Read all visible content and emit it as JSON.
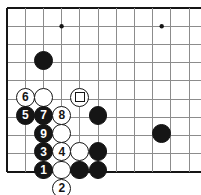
{
  "figure": {
    "board": {
      "origin_x": 7,
      "origin_y": 8,
      "spacing": 18.2,
      "cols": 11,
      "rows": 10,
      "line_color": "#8c8c8c",
      "edge_color": "#151515",
      "background": "#ffffff",
      "left_edge_thick": true,
      "top_edge_thick": true,
      "bottom_edge_thick": true,
      "right_edge_thick": false,
      "bottom_row_index": 9,
      "star_points": [
        {
          "col": 3,
          "row": 1
        },
        {
          "col": 8.5,
          "row": 1
        }
      ]
    },
    "stone_radius": 9.4,
    "stones": [
      {
        "id": "black-upper-left",
        "color": "black",
        "label": "",
        "col": 2,
        "row": 2.9,
        "marker": "none"
      },
      {
        "id": "white-6",
        "color": "white",
        "label": "6",
        "col": 1,
        "row": 4.9,
        "marker": "none"
      },
      {
        "id": "white-plain-top",
        "color": "white",
        "label": "",
        "col": 2,
        "row": 4.9,
        "marker": "none"
      },
      {
        "id": "white-marked",
        "color": "white",
        "label": "",
        "col": 4,
        "row": 4.9,
        "marker": "square"
      },
      {
        "id": "black-5",
        "color": "black",
        "label": "5",
        "col": 1,
        "row": 5.9,
        "marker": "none"
      },
      {
        "id": "black-7",
        "color": "black",
        "label": "7",
        "col": 2,
        "row": 5.9,
        "marker": "none"
      },
      {
        "id": "white-8",
        "color": "white",
        "label": "8",
        "col": 3,
        "row": 5.9,
        "marker": "none"
      },
      {
        "id": "black-right-upper",
        "color": "black",
        "label": "",
        "col": 5,
        "row": 5.9,
        "marker": "none"
      },
      {
        "id": "black-9",
        "color": "black",
        "label": "9",
        "col": 2,
        "row": 6.9,
        "marker": "none"
      },
      {
        "id": "white-plain-mid",
        "color": "white",
        "label": "",
        "col": 3,
        "row": 6.9,
        "marker": "none"
      },
      {
        "id": "black-far-right",
        "color": "black",
        "label": "",
        "col": 8.5,
        "row": 6.9,
        "marker": "none"
      },
      {
        "id": "black-3",
        "color": "black",
        "label": "3",
        "col": 2,
        "row": 7.9,
        "marker": "none"
      },
      {
        "id": "white-4",
        "color": "white",
        "label": "4",
        "col": 3,
        "row": 7.9,
        "marker": "none"
      },
      {
        "id": "white-plain-low",
        "color": "white",
        "label": "",
        "col": 4,
        "row": 7.9,
        "marker": "none"
      },
      {
        "id": "black-low-right",
        "color": "black",
        "label": "",
        "col": 5,
        "row": 7.9,
        "marker": "none"
      },
      {
        "id": "black-1",
        "color": "black",
        "label": "1",
        "col": 2,
        "row": 8.9,
        "marker": "none"
      },
      {
        "id": "white-plain-bottom",
        "color": "white",
        "label": "",
        "col": 3,
        "row": 8.9,
        "marker": "none"
      },
      {
        "id": "black-bottom-a",
        "color": "black",
        "label": "",
        "col": 4,
        "row": 8.9,
        "marker": "none"
      },
      {
        "id": "black-bottom-b",
        "color": "black",
        "label": "",
        "col": 5,
        "row": 8.9,
        "marker": "none"
      },
      {
        "id": "white-2",
        "color": "white",
        "label": "2",
        "col": 3,
        "row": 9.9,
        "marker": "none"
      }
    ]
  }
}
